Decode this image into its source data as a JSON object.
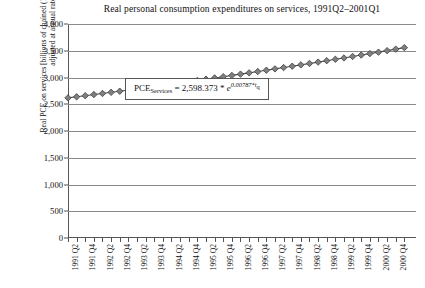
{
  "chart_data": {
    "type": "line",
    "title": "Real personal consumption expenditures on services, 1991Q2–2001Q1",
    "xlabel": "",
    "ylabel": "Real PCE on services [billions of chained (1996) dollars; seasonally adjusted at annual rates]",
    "ylim": [
      0,
      4000
    ],
    "ytick_labels": [
      "0",
      "500",
      "1,000",
      "1,500",
      "2,000",
      "2,500",
      "3,000",
      "3,500",
      "4,000"
    ],
    "ytick_values": [
      0,
      500,
      1000,
      1500,
      2000,
      2500,
      3000,
      3500,
      4000
    ],
    "grid": true,
    "legend": "none",
    "marker": "diamond",
    "marker_color": "#808080",
    "line_color": "#4d4d4d",
    "categories": [
      "1991 Q2",
      "1991 Q3",
      "1991 Q4",
      "1992 Q1",
      "1992 Q2",
      "1992 Q3",
      "1992 Q4",
      "1993 Q1",
      "1993 Q2",
      "1993 Q3",
      "1993 Q4",
      "1994 Q1",
      "1994 Q2",
      "1994 Q3",
      "1994 Q4",
      "1995 Q1",
      "1995 Q2",
      "1995 Q3",
      "1995 Q4",
      "1996 Q1",
      "1996 Q2",
      "1996 Q3",
      "1996 Q4",
      "1997 Q1",
      "1997 Q2",
      "1997 Q3",
      "1997 Q4",
      "1998 Q1",
      "1998 Q2",
      "1998 Q3",
      "1998 Q4",
      "1999 Q1",
      "1999 Q2",
      "1999 Q3",
      "1999 Q4",
      "2000 Q1",
      "2000 Q2",
      "2000 Q3",
      "2000 Q4",
      "2001 Q1"
    ],
    "xtick_labels_shown": [
      "1991 Q2",
      "1991 Q4",
      "1992 Q2",
      "1992 Q4",
      "1993 Q2",
      "1993 Q4",
      "1994 Q2",
      "1994 Q4",
      "1995 Q2",
      "1995 Q4",
      "1996 Q2",
      "1996 Q4",
      "1997 Q2",
      "1997 Q4",
      "1998 Q2",
      "1998 Q4",
      "1999 Q2",
      "1999 Q4",
      "2000 Q2",
      "2000 Q4"
    ],
    "values": [
      2619,
      2639,
      2660,
      2681,
      2702,
      2723,
      2744,
      2766,
      2788,
      2810,
      2832,
      2854,
      2877,
      2899,
      2922,
      2945,
      2968,
      2992,
      3015,
      3039,
      3063,
      3087,
      3111,
      3136,
      3161,
      3186,
      3211,
      3236,
      3262,
      3288,
      3314,
      3340,
      3366,
      3393,
      3420,
      3447,
      3474,
      3502,
      3530,
      3558
    ]
  },
  "equation": {
    "lhs": "PCE",
    "lhs_sub": "Services",
    "equals": "= 2,598.373 * ",
    "base": "e",
    "exponent": "0.00787*t",
    "exponent_sub": "q"
  }
}
